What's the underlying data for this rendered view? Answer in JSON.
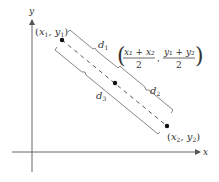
{
  "diagram": {
    "type": "midpoint-formula",
    "axes": {
      "x_label": "x",
      "y_label": "y"
    },
    "points": {
      "p1": {
        "label_var_x": "x",
        "label_sub_x": "1",
        "label_var_y": "y",
        "label_sub_y": "1"
      },
      "p2": {
        "label_var_x": "x",
        "label_sub_x": "2",
        "label_var_y": "y",
        "label_sub_y": "2"
      },
      "midpoint": {
        "x_num": "x₁ + x₂",
        "y_num": "y₁ + y₂",
        "den": "2"
      }
    },
    "distances": {
      "d1": {
        "var": "d",
        "sub": "1"
      },
      "d2": {
        "var": "d",
        "sub": "2"
      },
      "d3": {
        "var": "d",
        "sub": "3"
      }
    },
    "colors": {
      "line": "#555555",
      "point": "#111111",
      "text": "#333333"
    }
  }
}
